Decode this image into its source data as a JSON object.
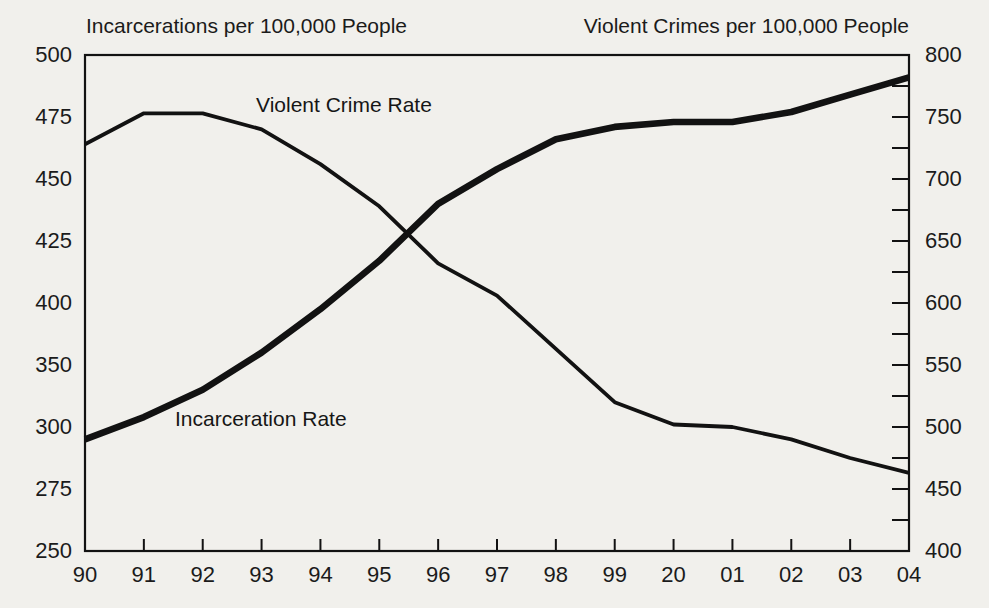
{
  "chart_data": {
    "type": "line",
    "title": "",
    "categories": [
      "90",
      "91",
      "92",
      "93",
      "94",
      "95",
      "96",
      "97",
      "98",
      "99",
      "20",
      "01",
      "02",
      "03",
      "04"
    ],
    "series": [
      {
        "name": "Incarceration Rate",
        "axis": "left",
        "style": "thick",
        "values": [
          295,
          308,
          330,
          360,
          395,
          417,
          440,
          454,
          466,
          471,
          473,
          473,
          477,
          484,
          491
        ]
      },
      {
        "name": "Violent Crime Rate",
        "axis": "right",
        "style": "thin",
        "values": [
          728,
          753,
          753,
          740,
          712,
          678,
          632,
          606,
          563,
          520,
          502,
          500,
          490,
          475,
          463
        ]
      }
    ],
    "left_axis": {
      "title": "Incarcerations per 100,000 People",
      "tick_labels": [
        "500",
        "475",
        "450",
        "425",
        "400",
        "350",
        "300",
        "275",
        "250"
      ],
      "tick_values": [
        500,
        475,
        450,
        425,
        400,
        350,
        300,
        275,
        250
      ],
      "note": "labels equally spaced on axis (non-linear value scale), no tick marks"
    },
    "right_axis": {
      "title": "Violent Crimes per 100,000 People",
      "tick_labels": [
        "800",
        "750",
        "700",
        "650",
        "600",
        "550",
        "500",
        "450",
        "400"
      ],
      "tick_values": [
        800,
        750,
        700,
        650,
        600,
        550,
        500,
        450,
        400
      ],
      "range": [
        400,
        800
      ],
      "minor_tick_step": 25
    },
    "annotations": [
      {
        "text": "Violent Crime Rate",
        "series": "Violent Crime Rate"
      },
      {
        "text": "Incarceration Rate",
        "series": "Incarceration Rate"
      }
    ],
    "layout": {
      "grid": "off",
      "legend": "inline-annotations",
      "border": "full-box"
    },
    "colors": {
      "line": "#121212",
      "text": "#1b1b1b",
      "background": "#f1f0ec"
    }
  }
}
